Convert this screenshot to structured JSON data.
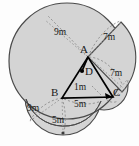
{
  "figure": {
    "colors": {
      "shade_fill": "#d6d6d6",
      "shade_stroke": "#4a4a4a",
      "dash_stroke": "#8c8c8c",
      "triangle_stroke": "#000000",
      "label_color": "#1a1a1a",
      "background": "#fdfdfd"
    },
    "vertices": [
      {
        "name": "A",
        "label": "A",
        "x": 88,
        "y": 57
      },
      {
        "name": "D",
        "label": "D",
        "x": 82,
        "y": 71
      },
      {
        "name": "B",
        "label": "B",
        "x": 62,
        "y": 98
      },
      {
        "name": "C",
        "label": "C",
        "x": 113,
        "y": 97
      }
    ],
    "vertex_labels": [
      {
        "name": "vertex-label-a",
        "text": "A",
        "x": 80,
        "y": 44
      },
      {
        "name": "vertex-label-d",
        "text": "D",
        "x": 85,
        "y": 68
      },
      {
        "name": "vertex-label-b",
        "text": "B",
        "x": 51,
        "y": 88
      },
      {
        "name": "vertex-label-c",
        "text": "C",
        "x": 113,
        "y": 88
      }
    ],
    "dimension_labels": [
      {
        "name": "dim-9m-top-left",
        "text": "9m",
        "x": 54,
        "y": 28
      },
      {
        "name": "dim-7m-top-right",
        "text": "7m",
        "x": 103,
        "y": 33
      },
      {
        "name": "dim-7m-right",
        "text": "7m",
        "x": 110,
        "y": 69
      },
      {
        "name": "dim-1m-center",
        "text": "1m",
        "x": 74,
        "y": 84
      },
      {
        "name": "dim-5m-right-low",
        "text": "5m",
        "x": 74,
        "y": 100
      },
      {
        "name": "dim-9m-left-low",
        "text": "9m",
        "x": 27,
        "y": 105
      },
      {
        "name": "dim-5m-bottom",
        "text": "5m",
        "x": 52,
        "y": 117
      }
    ],
    "measurements": {
      "A_radius_long": "9m",
      "A_radius_short": "7m",
      "C_radius": "7m",
      "D_segment": "1m",
      "B_radius_long": "9m",
      "B_radius_short": "5m",
      "C_to_B_arc": "5m"
    }
  }
}
